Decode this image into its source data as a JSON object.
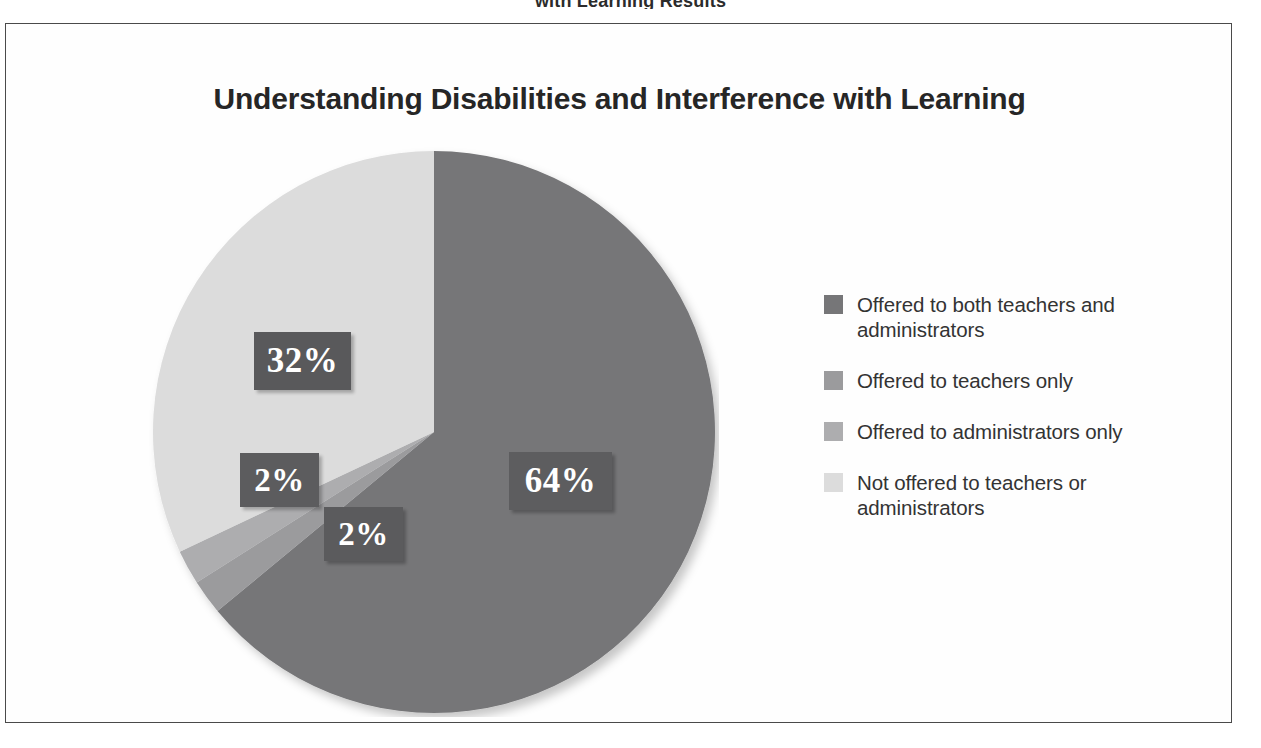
{
  "page": {
    "header_fragment": "with Learning Results"
  },
  "chart_data": {
    "type": "pie",
    "title": "Understanding Disabilities and Interference with Learning",
    "xlabel": "",
    "ylabel": "",
    "legend_position": "right",
    "grid": false,
    "unit": "%",
    "start_angle_deg": 0,
    "direction": "clockwise",
    "categories": [
      "Offered to both teachers and administrators",
      "Offered to teachers only",
      "Offered to administrators only",
      "Not offered to teachers or administrators"
    ],
    "values": [
      64,
      2,
      2,
      32
    ],
    "data_labels": [
      "64%",
      "2%",
      "2%",
      "32%"
    ],
    "colors": [
      "#767678",
      "#9b9b9d",
      "#adadaf",
      "#dcdcdc"
    ]
  },
  "pie_labels": {
    "slice_64": "64%",
    "slice_2_administrators": "2%",
    "slice_2_teachers": "2%",
    "slice_32": "32%"
  },
  "legend": {
    "items": [
      {
        "label": "Offered to both teachers and administrators",
        "color": "#767678"
      },
      {
        "label": "Offered to teachers only",
        "color": "#9b9b9d"
      },
      {
        "label": "Offered to administrators only",
        "color": "#adadaf"
      },
      {
        "label": "Not offered to teachers or administrators",
        "color": "#dcdcdc"
      }
    ]
  }
}
